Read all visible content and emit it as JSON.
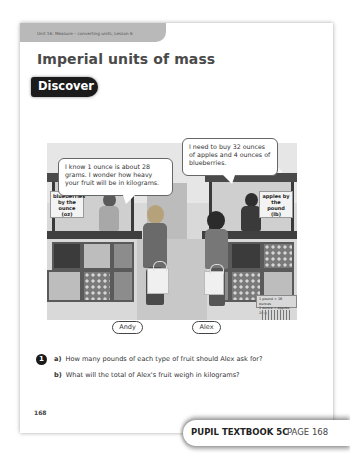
{
  "header": {
    "unit_label": "Unit 16: Measure – converting units, Lesson 6",
    "title": "Imperial units of mass",
    "section_badge": "Discover"
  },
  "scene": {
    "speech_andy": "I know 1 ounce is about 28 grams. I wonder how heavy your fruit will be in kilograms.",
    "speech_alex": "I need to buy 32 ounces of apples and 4 ounces of blueberries.",
    "sign_left": [
      "blueberries",
      "by the ounce",
      "(oz)"
    ],
    "sign_right": [
      "apples by",
      "the pound",
      "(lb)"
    ],
    "conversion_note": [
      "1 pound = 16 ounces",
      "1 ounce = approx. 28 g"
    ],
    "names": [
      "Andy",
      "Alex"
    ]
  },
  "question": {
    "number": "1",
    "parts": [
      {
        "label": "a)",
        "text": "How many pounds of each type of fruit should Alex ask for?"
      },
      {
        "label": "b)",
        "text": "What will the total of Alex's fruit weigh in kilograms?"
      }
    ]
  },
  "page_number": "168",
  "footer": {
    "book": "PUPIL TEXTBOOK 5C",
    "page": "PAGE 168"
  }
}
